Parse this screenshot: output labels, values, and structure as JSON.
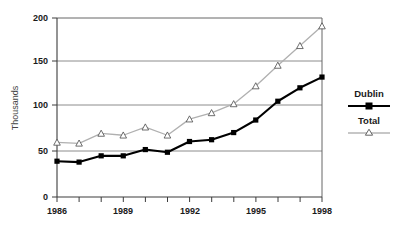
{
  "chart_data": {
    "type": "line",
    "title": "",
    "subtitle": "",
    "xlabel": "",
    "ylabel": "Thousands",
    "x": [
      1986,
      1987,
      1988,
      1989,
      1990,
      1991,
      1992,
      1993,
      1994,
      1995,
      1996,
      1997,
      1998
    ],
    "xtick_labels": [
      "1986",
      "",
      "",
      "1989",
      "",
      "",
      "1992",
      "",
      "",
      "1995",
      "",
      "",
      "1998"
    ],
    "ytick_labels": [
      "0",
      "50",
      "100",
      "150",
      "200"
    ],
    "yticks": [
      0,
      50,
      100,
      150,
      200
    ],
    "ylim": [
      0,
      200
    ],
    "xlim": [
      1986,
      1998
    ],
    "grid": "horizontal",
    "legend_position": "right",
    "series": [
      {
        "name": "Dublin",
        "marker": "filled-square",
        "color": "#000000",
        "values": [
          40,
          39,
          46,
          46,
          53,
          50,
          62,
          64,
          72,
          86,
          107,
          122,
          134
        ]
      },
      {
        "name": "Total",
        "marker": "open-triangle",
        "color": "#b0b0b0",
        "values": [
          61,
          60,
          71,
          69,
          78,
          69,
          87,
          94,
          104,
          124,
          147,
          169,
          191
        ]
      }
    ]
  },
  "axis": {
    "y_title": "Thousands",
    "y_labels": [
      "200",
      "150",
      "100",
      "50",
      "0"
    ],
    "x_labels": [
      "1986",
      "1989",
      "1992",
      "1995",
      "1998"
    ]
  },
  "legend": {
    "entries": [
      {
        "label": "Dublin"
      },
      {
        "label": "Total"
      }
    ]
  },
  "colors": {
    "dublin_line": "#000000",
    "total_line": "#b5b5b5",
    "grid": "#8c8c8c",
    "axis": "#555555",
    "text": "#1a1a1a"
  }
}
